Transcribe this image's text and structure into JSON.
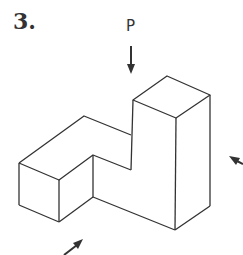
{
  "problem": {
    "number": "3.",
    "view_label": "P"
  },
  "figure": {
    "type": "isometric-solid",
    "stroke_color": "#333333",
    "arrows": [
      {
        "name": "top-view-arrow",
        "label": "P",
        "direction": "down"
      },
      {
        "name": "right-view-arrow",
        "direction": "up-left"
      },
      {
        "name": "front-view-arrow",
        "direction": "up-right"
      }
    ]
  }
}
